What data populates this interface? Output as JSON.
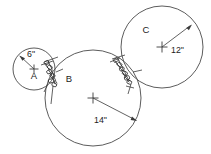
{
  "drawing": {
    "title": "Three tangent circles with radius dimensions",
    "background_color": "#ffffff",
    "line_color": "#3a3a3a",
    "text_color": "#1c1c1c",
    "units": "inches",
    "circles": [
      {
        "label": "A",
        "dimension_text": "6\"",
        "radius_value": 6,
        "cx": 34,
        "cy": 69,
        "r": 21,
        "label_x": 34,
        "label_y": 79,
        "dim_text_x": 27,
        "dim_text_y": 57,
        "dim_angle_deg": 215
      },
      {
        "label": "B",
        "dimension_text": "14\"",
        "radius_value": 14,
        "cx": 93,
        "cy": 98,
        "r": 48,
        "label_x": 69,
        "label_y": 82,
        "dim_text_x": 94,
        "dim_text_y": 123,
        "dim_angle_deg": 27
      },
      {
        "label": "C",
        "dimension_text": "12\"",
        "radius_value": 12,
        "cx": 162,
        "cy": 47,
        "r": 41,
        "label_x": 146,
        "label_y": 33,
        "dim_text_x": 171,
        "dim_text_y": 53,
        "dim_angle_deg": -35
      }
    ],
    "joints": [
      {
        "name": "joint-a-b",
        "x": 52,
        "y": 76,
        "description": "chain coupling between circle A and circle B"
      },
      {
        "name": "joint-b-c",
        "x": 128,
        "y": 70,
        "description": "chain coupling between circle B and circle C"
      }
    ]
  }
}
